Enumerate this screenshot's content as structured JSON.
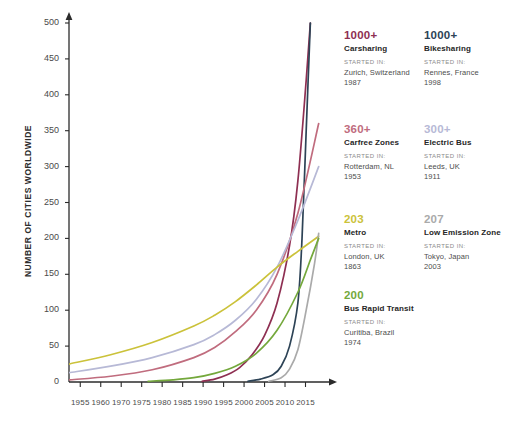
{
  "chart_data": {
    "type": "line",
    "title": "",
    "xlabel": "",
    "ylabel": "NUMBER OF CITIES WORLDWIDE",
    "xlim": [
      1955,
      2017
    ],
    "ylim": [
      0,
      500
    ],
    "grid": false,
    "legend_position": "right",
    "y_ticks": [
      "0",
      "50",
      "100",
      "150",
      "200",
      "250",
      "300",
      "350",
      "400",
      "450",
      "500"
    ],
    "y_tick_values": [
      0,
      50,
      100,
      150,
      200,
      250,
      300,
      350,
      400,
      450,
      500
    ],
    "x_ticks": [
      "1955",
      "1960",
      "1970",
      "1975",
      "1980",
      "1985",
      "1990",
      "1995",
      "2000",
      "2005",
      "2010",
      "2015"
    ],
    "x_tick_values": [
      1955,
      1960,
      1965,
      1970,
      1975,
      1980,
      1985,
      1990,
      1995,
      2000,
      2005,
      2010
    ],
    "series": [
      {
        "name": "Carsharing",
        "color": "#8e2f52",
        "x": [
          1987,
          1990,
          1993,
          1996,
          1999,
          2002,
          2005,
          2008,
          2010,
          2012,
          2013
        ],
        "values": [
          1,
          4,
          10,
          20,
          38,
          65,
          110,
          190,
          280,
          420,
          500
        ]
      },
      {
        "name": "Bikesharing",
        "color": "#2d4356",
        "x": [
          1998,
          2001,
          2004,
          2006,
          2008,
          2010,
          2011,
          2012,
          2013
        ],
        "values": [
          1,
          4,
          10,
          22,
          50,
          110,
          200,
          350,
          500
        ]
      },
      {
        "name": "Carfree Zones",
        "color": "#c06c7e",
        "x": [
          1955,
          1965,
          1975,
          1985,
          1990,
          1995,
          2000,
          2005,
          2010,
          2015
        ],
        "values": [
          3,
          8,
          17,
          34,
          48,
          70,
          100,
          150,
          235,
          360
        ]
      },
      {
        "name": "Electric Bus",
        "color": "#b7b9d6",
        "x": [
          1955,
          1965,
          1975,
          1985,
          1990,
          1995,
          2000,
          2005,
          2010,
          2015
        ],
        "values": [
          13,
          22,
          34,
          52,
          66,
          86,
          115,
          160,
          225,
          300
        ]
      },
      {
        "name": "Metro",
        "color": "#cbc23a",
        "x": [
          1955,
          1965,
          1975,
          1985,
          1990,
          1995,
          2000,
          2005,
          2010,
          2015
        ],
        "values": [
          25,
          38,
          55,
          78,
          93,
          112,
          135,
          160,
          182,
          203
        ]
      },
      {
        "name": "Low Emission Zone",
        "color": "#aaaaaa",
        "x": [
          2003,
          2006,
          2008,
          2010,
          2012,
          2014,
          2015
        ],
        "values": [
          1,
          6,
          18,
          45,
          100,
          165,
          207
        ]
      },
      {
        "name": "Bus Rapid Transit",
        "color": "#74a83c",
        "x": [
          1974,
          1980,
          1985,
          1990,
          1995,
          2000,
          2005,
          2010,
          2013,
          2015
        ],
        "values": [
          1,
          3,
          6,
          12,
          22,
          40,
          72,
          125,
          170,
          200
        ]
      }
    ]
  },
  "legend": {
    "started_label": "STARTED IN:",
    "entries": [
      {
        "count": "1000+",
        "name": "Carsharing",
        "started_label": "STARTED IN:",
        "city": "Zurich, Switzerland",
        "year": "1987",
        "color": "#8e2f52"
      },
      {
        "count": "1000+",
        "name": "Bikesharing",
        "started_label": "STARTED IN:",
        "city": "Rennes, France",
        "year": "1998",
        "color": "#2d4356"
      },
      {
        "count": "360+",
        "name": "Carfree Zones",
        "started_label": "STARTED IN:",
        "city": "Rotterdam, NL",
        "year": "1953",
        "color": "#c06c7e"
      },
      {
        "count": "300+",
        "name": "Electric Bus",
        "started_label": "STARTED IN:",
        "city": "Leeds, UK",
        "year": "1911",
        "color": "#b7b9d6"
      },
      {
        "count": "203",
        "name": "Metro",
        "started_label": "STARTED IN:",
        "city": "London, UK",
        "year": "1863",
        "color": "#cbc23a"
      },
      {
        "count": "207",
        "name": "Low Emission Zone",
        "started_label": "STARTED IN:",
        "city": "Tokyo, Japan",
        "year": "2003",
        "color": "#aaaaaa"
      },
      {
        "count": "200",
        "name": "Bus Rapid Transit",
        "started_label": "STARTED IN:",
        "city": "Curitiba, Brazil",
        "year": "1974",
        "color": "#74a83c"
      }
    ]
  }
}
